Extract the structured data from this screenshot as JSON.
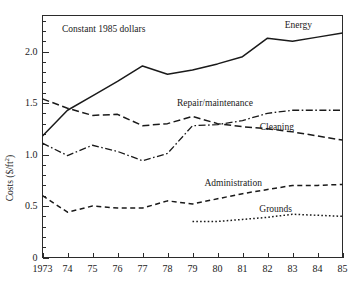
{
  "chart_data": {
    "type": "line",
    "title": "",
    "annotation": "Constant 1985 dollars",
    "xlabel": "",
    "ylabel": "Costs ($/ft",
    "ylabel_superscript": "2",
    "ylabel_suffix": ")",
    "grid": false,
    "legend_position": "inline-right",
    "xlim": [
      1973,
      1985
    ],
    "ylim": [
      0,
      2.35
    ],
    "x": [
      1973,
      1974,
      1975,
      1976,
      1977,
      1978,
      1979,
      1980,
      1981,
      1982,
      1983,
      1984,
      1985
    ],
    "xticklabels": [
      "1973",
      "74",
      "75",
      "76",
      "77",
      "78",
      "79",
      "80",
      "81",
      "82",
      "83",
      "84",
      "85"
    ],
    "yticks": [
      0,
      0.5,
      1.0,
      1.5,
      2.0
    ],
    "yticklabels": [
      "0",
      "0.5",
      "1.0",
      "1.5",
      "2.0"
    ],
    "y_minor_step": 0.1,
    "series": [
      {
        "name": "Energy",
        "label": "Energy",
        "style": "solid",
        "color": "#1a1a1a",
        "x": [
          1973,
          1974,
          1975,
          1976,
          1977,
          1978,
          1979,
          1980,
          1981,
          1982,
          1983,
          1984,
          1985
        ],
        "values": [
          1.18,
          1.43,
          1.57,
          1.71,
          1.86,
          1.78,
          1.82,
          1.88,
          1.95,
          2.13,
          2.1,
          2.14,
          2.18
        ]
      },
      {
        "name": "Repair/maintenance",
        "label": "Repair/maintenance",
        "style": "dashed",
        "color": "#1a1a1a",
        "x": [
          1973,
          1974,
          1975,
          1976,
          1977,
          1978,
          1979,
          1980,
          1981,
          1982,
          1983,
          1984,
          1985
        ],
        "values": [
          1.54,
          1.45,
          1.38,
          1.39,
          1.28,
          1.3,
          1.37,
          1.3,
          1.27,
          1.25,
          1.22,
          1.18,
          1.14
        ]
      },
      {
        "name": "Cleaning",
        "label": "Cleaning",
        "style": "dash-dot",
        "color": "#1a1a1a",
        "x": [
          1973,
          1974,
          1975,
          1976,
          1977,
          1978,
          1979,
          1980,
          1981,
          1982,
          1983,
          1984,
          1985
        ],
        "values": [
          1.11,
          0.99,
          1.09,
          1.03,
          0.94,
          1.01,
          1.28,
          1.29,
          1.33,
          1.4,
          1.43,
          1.43,
          1.43
        ]
      },
      {
        "name": "Administration",
        "label": "Administration",
        "style": "dashed-short",
        "color": "#1a1a1a",
        "x": [
          1973,
          1974,
          1975,
          1976,
          1977,
          1978,
          1979,
          1980,
          1981,
          1982,
          1983,
          1984,
          1985
        ],
        "values": [
          0.6,
          0.44,
          0.5,
          0.48,
          0.48,
          0.55,
          0.52,
          0.57,
          0.62,
          0.66,
          0.7,
          0.7,
          0.71
        ]
      },
      {
        "name": "Grounds",
        "label": "Grounds",
        "style": "dotted",
        "color": "#1a1a1a",
        "x": [
          1979,
          1980,
          1981,
          1982,
          1983,
          1984,
          1985
        ],
        "values": [
          0.35,
          0.35,
          0.37,
          0.39,
          0.42,
          0.41,
          0.4
        ]
      }
    ],
    "series_label_positions": [
      {
        "name": "Energy",
        "x": 312,
        "y": 28
      },
      {
        "name": "Repair/maintenance",
        "x": 253,
        "y": 106
      },
      {
        "name": "Cleaning",
        "x": 294,
        "y": 130
      },
      {
        "name": "Administration",
        "x": 262,
        "y": 186
      },
      {
        "name": "Grounds",
        "x": 292,
        "y": 212
      }
    ]
  }
}
